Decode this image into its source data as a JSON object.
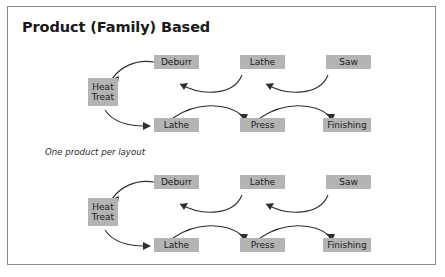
{
  "figure": {
    "title": "Product (Family) Based",
    "caption": "One product per layout",
    "border_color": "#8a8a8a",
    "background_color": "#ffffff",
    "node_fill_color": "#b4b4b4",
    "arrow_color": "#2e2e2e"
  },
  "diagrams": [
    {
      "id": "layout-1",
      "nodes": [
        {
          "id": "heat-treat",
          "label_line1": "Heat",
          "label_line2": "Treat",
          "lines": 2
        },
        {
          "id": "deburr-top",
          "label": "Deburr"
        },
        {
          "id": "lathe-top",
          "label": "Lathe"
        },
        {
          "id": "saw-top",
          "label": "Saw"
        },
        {
          "id": "lathe-bottom",
          "label": "Lathe"
        },
        {
          "id": "press",
          "label": "Press"
        },
        {
          "id": "finishing",
          "label": "Finishing"
        }
      ],
      "flows": [
        {
          "from": "saw-top",
          "to": "lathe-top"
        },
        {
          "from": "lathe-top",
          "to": "deburr-top"
        },
        {
          "from": "deburr-top",
          "to": "heat-treat"
        },
        {
          "from": "heat-treat",
          "to": "lathe-bottom"
        },
        {
          "from": "lathe-bottom",
          "to": "press"
        },
        {
          "from": "press",
          "to": "finishing"
        }
      ]
    },
    {
      "id": "layout-2",
      "nodes": [
        {
          "id": "heat-treat",
          "label_line1": "Heat",
          "label_line2": "Treat",
          "lines": 2
        },
        {
          "id": "deburr-top",
          "label": "Deburr"
        },
        {
          "id": "lathe-top",
          "label": "Lathe"
        },
        {
          "id": "saw-top",
          "label": "Saw"
        },
        {
          "id": "lathe-bottom",
          "label": "Lathe"
        },
        {
          "id": "press",
          "label": "Press"
        },
        {
          "id": "finishing",
          "label": "Finishing"
        }
      ],
      "flows": [
        {
          "from": "saw-top",
          "to": "lathe-top"
        },
        {
          "from": "lathe-top",
          "to": "deburr-top"
        },
        {
          "from": "deburr-top",
          "to": "heat-treat"
        },
        {
          "from": "heat-treat",
          "to": "lathe-bottom"
        },
        {
          "from": "lathe-bottom",
          "to": "press"
        },
        {
          "from": "press",
          "to": "finishing"
        }
      ]
    }
  ]
}
